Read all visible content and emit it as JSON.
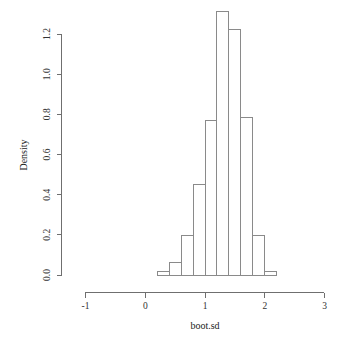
{
  "chart_data": {
    "type": "bar",
    "title": "",
    "subtitle": "",
    "xlabel": "boot.sd",
    "ylabel": "Density",
    "xlim": [
      -1.35,
      3.2
    ],
    "ylim": [
      0.0,
      1.33
    ],
    "grid": false,
    "legend": null,
    "bin_width": 0.2,
    "x_ticks": [
      "-1",
      "0",
      "1",
      "2",
      "3"
    ],
    "x_tick_values": [
      -1,
      0,
      1,
      2,
      3
    ],
    "y_ticks": [
      "0.0",
      "0.2",
      "0.4",
      "0.6",
      "0.8",
      "1.0",
      "1.2"
    ],
    "y_tick_values": [
      0.0,
      0.2,
      0.4,
      0.6,
      0.8,
      1.0,
      1.2
    ],
    "bin_edges": [
      0.2,
      0.4,
      0.6,
      0.8,
      1.0,
      1.2,
      1.4,
      1.6,
      1.8,
      2.0,
      2.2
    ],
    "categories": [
      "0.2-0.4",
      "0.4-0.6",
      "0.6-0.8",
      "0.8-1.0",
      "1.0-1.2",
      "1.2-1.4",
      "1.4-1.6",
      "1.6-1.8",
      "1.8-2.0",
      "2.0-2.2"
    ],
    "values": [
      0.015,
      0.06,
      0.195,
      0.45,
      0.77,
      1.31,
      1.22,
      0.785,
      0.195,
      0.015
    ]
  },
  "axes": {
    "x_axis_label": "boot.sd",
    "y_axis_label": "Density"
  }
}
